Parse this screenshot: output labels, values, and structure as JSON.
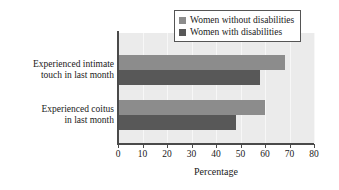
{
  "chart_data": {
    "type": "bar",
    "orientation": "horizontal",
    "title": "",
    "xlabel": "Percentage",
    "ylabel": "",
    "xlim": [
      0,
      80
    ],
    "xticks": [
      0,
      10,
      20,
      30,
      40,
      50,
      60,
      70,
      80
    ],
    "xtick_labels": [
      "0",
      "10",
      "20",
      "30",
      "40",
      "50",
      "60",
      "70",
      "80"
    ],
    "grid": true,
    "grid_axis": "x",
    "legend_position": "top-right",
    "categories": [
      "Experienced intimate touch in last month",
      "Experienced coitus in last month"
    ],
    "category_labels": [
      [
        "Experienced intimate",
        "touch in last month"
      ],
      [
        "Experienced coitus",
        "in last month"
      ]
    ],
    "series": [
      {
        "name": "Women without disabilities",
        "color": "#8c8c8c",
        "values": [
          68,
          60
        ]
      },
      {
        "name": "Women with disabilities",
        "color": "#585858",
        "values": [
          58,
          48
        ]
      }
    ]
  },
  "legend": {
    "items": [
      {
        "label": "Women without disabilities",
        "color": "#8c8c8c"
      },
      {
        "label": "Women with disabilities",
        "color": "#585858"
      }
    ]
  },
  "axis": {
    "x_title": "Percentage"
  },
  "colors": {
    "plot_background": "#ebebeb",
    "page_background": "#ffffff",
    "axis": "#4a4a4a",
    "gridline": "#f7f7f7",
    "text": "#1a1a1a",
    "legend_border": "#555555"
  }
}
